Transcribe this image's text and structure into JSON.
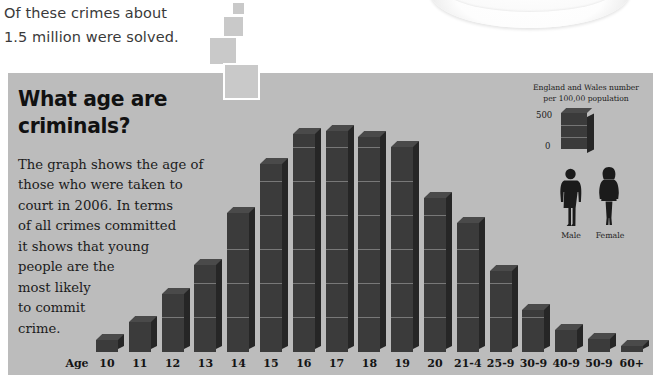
{
  "top_note": {
    "line1": "Of these crimes about",
    "line2": "1.5 million were solved."
  },
  "headline": {
    "line1": "What age are",
    "line2": "criminals?"
  },
  "body": [
    "The graph shows the age of",
    "those who were taken to",
    "court in 2006. In terms",
    "of all crimes committed",
    "it shows that young",
    "people are the",
    "most likely",
    "to commit",
    "crime."
  ],
  "legend": {
    "line1": "England and Wales number",
    "line2": "per 100,00 population",
    "scale_max": "500",
    "scale_min": "0",
    "male_label": "Male",
    "female_label": "Female"
  },
  "axis_title": "Age",
  "colors": {
    "panel": "#bcbcbc",
    "bar_face": "#3b3b3b",
    "bar_side": "#262626",
    "bar_top": "#4a4a4a",
    "square": "#c9c9c9",
    "text": "#1b1b1b"
  },
  "chart_data": {
    "type": "bar",
    "title": "What age are criminals?",
    "xlabel": "Age",
    "ylabel": "England and Wales number per 100,00 population",
    "ylim": [
      0,
      500
    ],
    "grid": false,
    "legend_position": "right",
    "categories": [
      "10",
      "11",
      "12",
      "13",
      "14",
      "15",
      "16",
      "17",
      "18",
      "19",
      "20",
      "21-4",
      "25-9",
      "30-9",
      "40-9",
      "50-9",
      "60+"
    ],
    "values": [
      18,
      45,
      88,
      132,
      210,
      285,
      330,
      335,
      326,
      310,
      234,
      196,
      122,
      63,
      33,
      20,
      8
    ],
    "annotations": [
      "Male",
      "Female"
    ]
  }
}
